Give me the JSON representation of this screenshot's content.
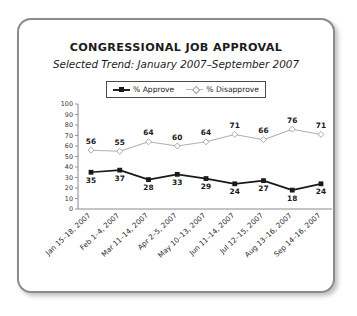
{
  "chart_data": {
    "type": "line",
    "title": "CONGRESSIONAL JOB APPROVAL",
    "subtitle": "Selected Trend: January 2007–September 2007",
    "xlabel": "",
    "ylabel": "",
    "ylim": [
      0,
      100
    ],
    "ytick_step": 10,
    "yticks": [
      "100",
      "90",
      "80",
      "70",
      "60",
      "50",
      "40",
      "30",
      "20",
      "10",
      "0"
    ],
    "grid": false,
    "legend_position": "top-center",
    "categories": [
      "Jan 15–18, 2007",
      "Feb 1–4, 2007",
      "Mar 11–14, 2007",
      "Apr 2–5, 2007",
      "May 10–13, 2007",
      "Jun 11–14, 2007",
      "Jul 12–15, 2007",
      "Aug 13–16, 2007",
      "Sep 14–16, 2007"
    ],
    "series": [
      {
        "name": "% Approve",
        "marker": "square-filled",
        "color": "#1a1a1a",
        "values": [
          35,
          37,
          28,
          33,
          29,
          24,
          27,
          18,
          24
        ],
        "labels": [
          "35",
          "37",
          "28",
          "33",
          "29",
          "24",
          "27",
          "18",
          "24"
        ]
      },
      {
        "name": "% Disapprove",
        "marker": "diamond-open",
        "color": "#b0b0b0",
        "values": [
          56,
          55,
          64,
          60,
          64,
          71,
          66,
          76,
          71
        ],
        "labels": [
          "56",
          "55",
          "64",
          "60",
          "64",
          "71",
          "66",
          "76",
          "71"
        ]
      }
    ]
  },
  "legend": {
    "approve_label": "% Approve",
    "disapprove_label": "% Disapprove"
  },
  "colors": {
    "approve": "#1a1a1a",
    "disapprove": "#b0b0b0",
    "card_border": "#8c8c8c",
    "axis": "#7d7d7d",
    "text": "#1c1c1c"
  }
}
